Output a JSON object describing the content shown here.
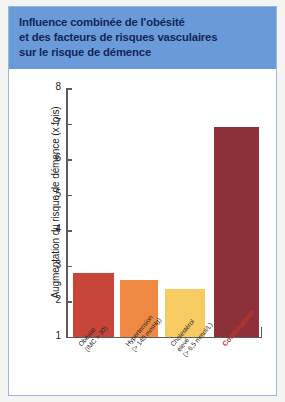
{
  "header": {
    "title": "Influence combinée de l'obésité\net des facteurs de risques vasculaires\nsur le risque de démence",
    "background_color": "#6a9ad8",
    "text_color": "#12265a"
  },
  "chart_data": {
    "type": "bar",
    "title": "Influence combinée de l'obésité et des facteurs de risques vasculaires sur le risque de démence",
    "xlabel": "",
    "ylabel": "Augmentation du risque de démence (x fois)",
    "ylim": [
      1,
      8
    ],
    "yticks": [
      1,
      2,
      3,
      4,
      5,
      6,
      7,
      8
    ],
    "ytick_labels": [
      "1",
      "2",
      "3",
      "4",
      "5",
      "6",
      "7",
      "8"
    ],
    "grid": false,
    "legend": "none",
    "categories": [
      "Obésité (IMC > 30)",
      "Hypertension (> 140 mmHg)",
      "Cholestérol élevé (> 6,5 mmol/L)",
      "Combinaison"
    ],
    "category_lines": [
      "Obésité\n(IMC > 30)",
      "Hypertension\n(> 140 mmHg)",
      "Cholestérol\nélevé\n(> 6,5 mmol/L)",
      "Combinaison"
    ],
    "values": [
      2.8,
      2.6,
      2.35,
      6.9
    ],
    "bar_colors": [
      "#c8453a",
      "#ef8843",
      "#f5cb62",
      "#8e3039"
    ],
    "highlight_category": "Combinaison",
    "highlight_color": "#c0392b"
  }
}
